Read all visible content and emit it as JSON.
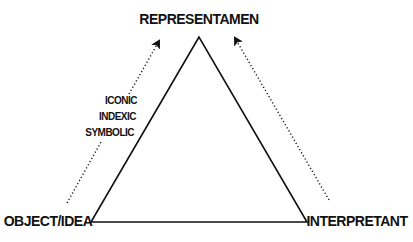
{
  "diagram": {
    "nodes": {
      "top": "REPRESENTAMEN",
      "bottom_left": "OBJECT/IDEA",
      "bottom_right": "INTERPRETANT"
    },
    "modes": [
      "ICONIC",
      "INDEXIC",
      "SYMBOLIC"
    ],
    "edges": [
      {
        "from": "OBJECT/IDEA",
        "to": "REPRESENTAMEN",
        "style": "dotted-arrow"
      },
      {
        "from": "INTERPRETANT",
        "to": "REPRESENTAMEN",
        "style": "dotted-arrow"
      }
    ],
    "colors": {
      "ink": "#111111",
      "background": "#ffffff"
    }
  }
}
